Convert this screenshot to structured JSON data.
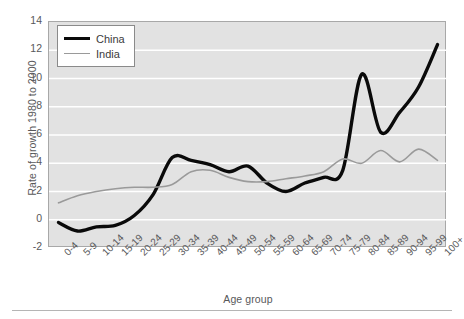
{
  "chart_data": {
    "type": "line",
    "title": "",
    "xlabel": "Age group",
    "ylabel": "Rate of growth 1980 to 2000",
    "categories": [
      "0-4",
      "5-9",
      "10-14",
      "15-19",
      "20-24",
      "25-29",
      "30-34",
      "35-39",
      "40-44",
      "45-49",
      "50-54",
      "55-59",
      "60-64",
      "65-69",
      "70-74",
      "75-79",
      "80-84",
      "85-89",
      "90-94",
      "95-99",
      "100+"
    ],
    "ylim": [
      -2,
      14
    ],
    "yticks": [
      -2,
      0,
      2,
      4,
      6,
      8,
      10,
      12,
      14
    ],
    "grid": true,
    "legend_position": "top-left",
    "series": [
      {
        "name": "China",
        "color": "#0a0a0a",
        "values": [
          -0.2,
          -0.8,
          -0.5,
          -0.4,
          0.3,
          1.8,
          4.4,
          4.2,
          3.9,
          3.4,
          3.8,
          2.6,
          2.0,
          2.6,
          3.0,
          3.5,
          10.3,
          6.2,
          7.6,
          9.4,
          12.4
        ]
      },
      {
        "name": "India",
        "color": "#9a9a9a",
        "values": [
          1.2,
          1.7,
          2.0,
          2.2,
          2.3,
          2.3,
          2.5,
          3.4,
          3.5,
          3.0,
          2.7,
          2.7,
          2.9,
          3.1,
          3.4,
          4.3,
          4.0,
          4.9,
          4.1,
          5.0,
          4.2
        ]
      }
    ]
  },
  "legend": {
    "items": [
      {
        "label": "China"
      },
      {
        "label": "India"
      }
    ]
  }
}
